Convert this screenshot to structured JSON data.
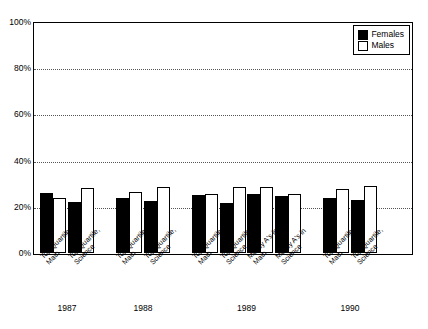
{
  "chart_data": {
    "type": "bar",
    "title": "",
    "xlabel": "",
    "ylabel": "",
    "ylim": [
      0,
      100
    ],
    "ytick_labels": [
      "0%",
      "20%",
      "40%",
      "60%",
      "80%",
      "100%"
    ],
    "ytick_values": [
      0,
      20,
      40,
      60,
      80,
      100
    ],
    "grid": true,
    "grid_style": "dotted-horizontal",
    "legend_position": "top-right",
    "categories": [
      "Top Quartile, Math",
      "Top Quartile, Science",
      "Top Quartile, Math",
      "Top Quartile, Science",
      "Top Quartile, Math",
      "Top Quartile, Science",
      "Mostly A's in Math",
      "Mostly A's in Science",
      "Top Quartile, Math",
      "Top Quartile, Science"
    ],
    "series": [
      {
        "name": "Females",
        "color": "#000000",
        "values": [
          26,
          22,
          24,
          22.5,
          25,
          21.5,
          25.5,
          24.5,
          24,
          23
        ]
      },
      {
        "name": "Males",
        "color": "#ffffff",
        "values": [
          24,
          28,
          26.5,
          28.5,
          25.5,
          28.5,
          28.5,
          25.5,
          27.5,
          29
        ]
      }
    ],
    "groups": [
      {
        "year": "1987",
        "categories": [
          {
            "line1": "Top Quartile,",
            "line2": "Math"
          },
          {
            "line1": "Top Quartile,",
            "line2": "Science"
          }
        ]
      },
      {
        "year": "1988",
        "categories": [
          {
            "line1": "Top Quartile,",
            "line2": "Math"
          },
          {
            "line1": "Top Quartile,",
            "line2": "Science"
          }
        ]
      },
      {
        "year": "1989",
        "categories": [
          {
            "line1": "Top Quartile,",
            "line2": "Math"
          },
          {
            "line1": "Top Quartile,",
            "line2": "Science"
          },
          {
            "line1": "Mostly A's in",
            "line2": "Math"
          },
          {
            "line1": "Mostly A's in",
            "line2": "Science"
          }
        ]
      },
      {
        "year": "1990",
        "categories": [
          {
            "line1": "Top Quartile,",
            "line2": "Math"
          },
          {
            "line1": "Top Quartile,",
            "line2": "Science"
          }
        ]
      }
    ]
  },
  "legend": {
    "items": [
      {
        "label": "Females",
        "swatch": "filled-black-square"
      },
      {
        "label": "Males",
        "swatch": "open-white-square"
      }
    ]
  },
  "axis": {
    "y": {
      "ticks": [
        "100%",
        "80%",
        "60%",
        "40%",
        "20%",
        "0%"
      ]
    }
  },
  "colors": {
    "female_bar": "#000000",
    "male_bar": "#ffffff",
    "axis": "#000000",
    "grid": "#555555",
    "background": "#ffffff"
  }
}
